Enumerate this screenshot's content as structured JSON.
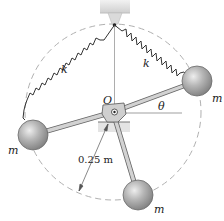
{
  "diagram": {
    "type": "mechanics-figure",
    "labels": {
      "spring_left": "k",
      "spring_right": "k",
      "pivot": "O",
      "angle": "θ",
      "radius": "0.25 m",
      "mass_left": "m",
      "mass_right": "m",
      "mass_bottom": "m"
    },
    "colors": {
      "ball_fill": "#a8a8a8",
      "ball_highlight": "#e6e6e6",
      "rod": "#c8c8c8",
      "rod_edge": "#666666",
      "dashed_circle": "#aaaaaa",
      "support": "#d8d8d8",
      "spring": "#333333"
    }
  }
}
